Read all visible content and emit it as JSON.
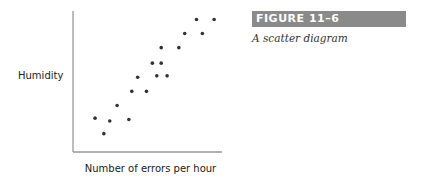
{
  "figure": {
    "label": "FIGURE 11–6",
    "caption": "A scatter diagram"
  },
  "chart_data": {
    "type": "scatter",
    "title": "",
    "xlabel": "Number of errors per hour",
    "ylabel": "Humidity",
    "grid": false,
    "legend": null,
    "xlim": [
      0,
      100
    ],
    "ylim": [
      0,
      100
    ],
    "points_note": "Unitless positions (0-100) estimated from pixel positions; axes have no ticks.",
    "x": [
      15,
      21,
      25,
      30,
      38,
      40,
      44,
      50,
      54,
      57,
      60,
      60,
      64,
      72,
      76,
      84,
      88,
      96
    ],
    "y": [
      24,
      13,
      22,
      33,
      23,
      43,
      53,
      43,
      63,
      54,
      74,
      63,
      54,
      74,
      84,
      94,
      84,
      94
    ],
    "marker_color": "#333333",
    "axis_color": "#999999"
  }
}
